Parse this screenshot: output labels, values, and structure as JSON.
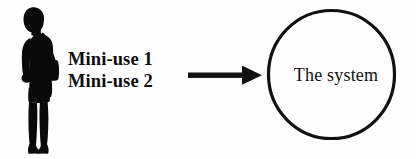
{
  "diagram": {
    "type": "use-case-diagram",
    "background_color": "#fefefe",
    "ink_color": "#111111",
    "actor": {
      "icon": "person-silhouette-icon",
      "description": "Standing woman silhouette with shoulder bag"
    },
    "use_cases": [
      {
        "label": "Mini-use 1"
      },
      {
        "label": "Mini-use 2"
      }
    ],
    "connector": {
      "icon": "right-arrow-icon",
      "direction": "right"
    },
    "system": {
      "shape": "circle",
      "label": "The system",
      "stroke_color": "#111111"
    }
  }
}
